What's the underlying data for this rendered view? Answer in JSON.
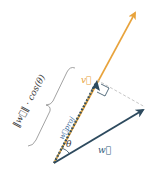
{
  "diagram": {
    "colors": {
      "v": "#e8a33c",
      "w": "#2d4a5e",
      "proj_dash": "#c9a24a",
      "helper": "#b8b8b8",
      "brace": "#8a8a8a",
      "text_dark": "#3a3a3a",
      "label_w": "#2d5a7a",
      "label_proj": "#3a6a9a"
    },
    "labels": {
      "v": "v⃗",
      "w": "w⃗",
      "w_proj": "w⃗proj",
      "theta": "θ",
      "brace_formula": "‖w⃗‖ · cos(θ)"
    },
    "points": {
      "origin": [
        54,
        163
      ],
      "v_tip": [
        136,
        10
      ],
      "w_tip": [
        146,
        108
      ],
      "proj_tip": [
        97,
        80
      ]
    }
  }
}
